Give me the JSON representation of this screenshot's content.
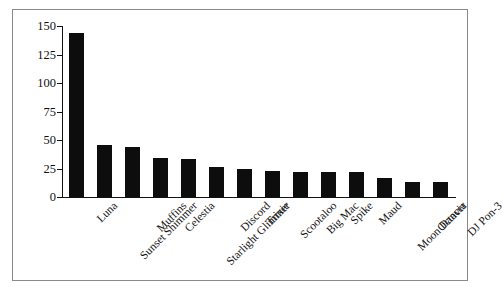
{
  "chart_data": {
    "type": "bar",
    "title": "",
    "subtitle": "",
    "xlabel": "",
    "ylabel": "",
    "ylim": [
      0,
      150
    ],
    "yticks": [
      0,
      25,
      50,
      75,
      100,
      125,
      150
    ],
    "grid": false,
    "legend": false,
    "bar_color": "#0d0d0d",
    "axis_color": "#111111",
    "frame_color": "#8a8a8a",
    "background": "#ffffff",
    "categories": [
      "Luna",
      "Sunset Shimmer",
      "Muffins",
      "Celestia",
      "Starlight Glimmer",
      "Discord",
      "Trixie",
      "Scootaloo",
      "Big Mac",
      "Spike",
      "Maud",
      "Moon Dancer",
      "Octavia",
      "DJ Pon-3"
    ],
    "values": [
      144,
      46,
      44,
      34,
      33,
      26,
      25,
      23,
      22,
      22,
      22,
      17,
      13,
      13
    ]
  }
}
